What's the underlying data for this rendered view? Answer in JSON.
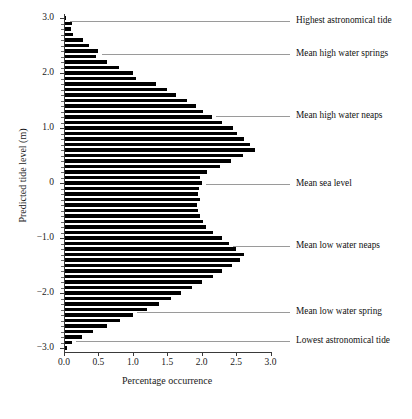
{
  "chart_data": {
    "type": "bar",
    "orientation": "horizontal",
    "title": "",
    "xlabel": "Percentage occurrence",
    "ylabel": "Predicted tide level (m)",
    "xlim": [
      0.0,
      3.0
    ],
    "ylim": [
      -3.0,
      3.0
    ],
    "xticks": [
      "0.0",
      "0.5",
      "1.0",
      "1.5",
      "2.0",
      "2.5",
      "3.0"
    ],
    "xtick_values": [
      0.0,
      0.5,
      1.0,
      1.5,
      2.0,
      2.5,
      3.0
    ],
    "yticks": [
      "3.0",
      "2.0",
      "1.0",
      "0",
      "-1.0",
      "-2.0",
      "-3.0"
    ],
    "ytick_values": [
      3.0,
      2.0,
      1.0,
      0.0,
      -1.0,
      -2.0,
      -3.0
    ],
    "grid": false,
    "legend": "none",
    "bar_color": "#000000",
    "bin_width": 0.1,
    "categories": [
      3.0,
      2.9,
      2.8,
      2.7,
      2.6,
      2.5,
      2.4,
      2.3,
      2.2,
      2.1,
      2.0,
      1.9,
      1.8,
      1.7,
      1.6,
      1.5,
      1.4,
      1.3,
      1.2,
      1.1,
      1.0,
      0.9,
      0.8,
      0.7,
      0.6,
      0.5,
      0.4,
      0.3,
      0.2,
      0.1,
      0.0,
      -0.1,
      -0.2,
      -0.3,
      -0.4,
      -0.5,
      -0.6,
      -0.7,
      -0.8,
      -0.9,
      -1.0,
      -1.1,
      -1.2,
      -1.3,
      -1.4,
      -1.5,
      -1.6,
      -1.7,
      -1.8,
      -1.9,
      -2.0,
      -2.1,
      -2.2,
      -2.3,
      -2.4,
      -2.5,
      -2.6,
      -2.7,
      -2.8,
      -2.9,
      -3.0
    ],
    "values": [
      0.03,
      0.12,
      0.1,
      0.13,
      0.28,
      0.36,
      0.49,
      0.46,
      0.62,
      0.8,
      1.0,
      1.05,
      1.33,
      1.5,
      1.62,
      1.78,
      1.92,
      2.02,
      2.15,
      2.3,
      2.45,
      2.52,
      2.62,
      2.7,
      2.77,
      2.6,
      2.42,
      2.26,
      2.08,
      1.98,
      2.0,
      1.96,
      1.95,
      1.97,
      1.93,
      1.95,
      1.98,
      2.02,
      2.06,
      2.16,
      2.3,
      2.4,
      2.5,
      2.62,
      2.55,
      2.44,
      2.3,
      2.16,
      2.0,
      1.86,
      1.7,
      1.55,
      1.38,
      1.2,
      1.0,
      0.82,
      0.62,
      0.42,
      0.26,
      0.12,
      0.05
    ],
    "annotations": [
      {
        "label": "Highest astronomical tide",
        "level": 2.95
      },
      {
        "label": "Mean high water springs",
        "level": 2.35
      },
      {
        "label": "Mean high water neaps",
        "level": 1.22
      },
      {
        "label": "Mean sea level",
        "level": -0.02
      },
      {
        "label": "Mean low water neaps",
        "level": -1.15
      },
      {
        "label": "Mean  low water spring",
        "level": -2.35
      },
      {
        "label": "Lowest astronomical tide",
        "level": -2.88
      }
    ]
  }
}
